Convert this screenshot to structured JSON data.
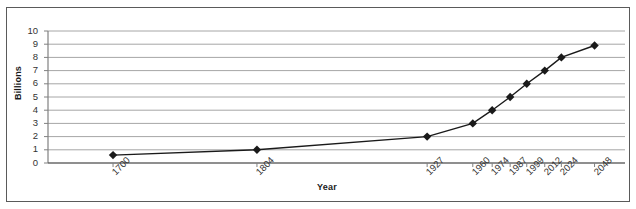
{
  "chart_data": {
    "type": "line",
    "title": "",
    "xlabel": "Year",
    "ylabel": "Billions",
    "categories": [
      "1700",
      "1804",
      "1927",
      "1960",
      "1974",
      "1987",
      "1999",
      "2012",
      "2024",
      "2048"
    ],
    "values": [
      0.6,
      1.0,
      2.0,
      3.0,
      4.0,
      5.0,
      6.0,
      7.0,
      8.0,
      8.9
    ],
    "x_positions": [
      1700,
      1804,
      1927,
      1960,
      1974,
      1987,
      1999,
      2012,
      2024,
      2048
    ],
    "xlim": [
      1653,
      2070
    ],
    "ylim": [
      0,
      10
    ],
    "ytick_labels": [
      "0",
      "1",
      "2",
      "3",
      "4",
      "5",
      "6",
      "7",
      "8",
      "9",
      "10"
    ],
    "ytick_values": [
      0,
      1,
      2,
      3,
      4,
      5,
      6,
      7,
      8,
      9,
      10
    ],
    "grid": "horizontal",
    "legend": "none",
    "marker": "diamond",
    "series_color": "#1a1a1a",
    "gridline_color": "#a6a6a6",
    "axis_color": "#808080",
    "border_color": "#5a5a5a"
  }
}
